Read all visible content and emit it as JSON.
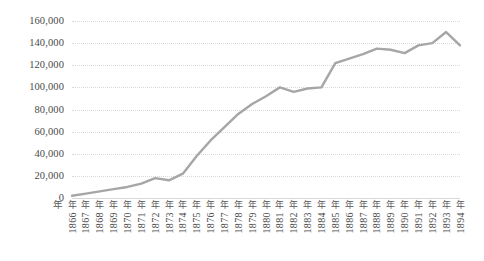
{
  "chart_data": {
    "type": "line",
    "title": "",
    "subtitle": "",
    "xlabel": "",
    "ylabel": "",
    "xlim": [
      1866,
      1894
    ],
    "ylim": [
      0,
      160000
    ],
    "grid": true,
    "legend": false,
    "series_color": "#a6a6a6",
    "axis_unit_label": "年",
    "x_tick_suffix": "年",
    "y_tick_labels": [
      "160,000",
      "140,000",
      "120,000",
      "100,000",
      "80,000",
      "60,000",
      "40,000",
      "20,000",
      "0"
    ],
    "y_tick_values": [
      160000,
      140000,
      120000,
      100000,
      80000,
      60000,
      40000,
      20000,
      0
    ],
    "categories": [
      "1866",
      "1867",
      "1868",
      "1869",
      "1870",
      "1871",
      "1872",
      "1873",
      "1874",
      "1875",
      "1876",
      "1877",
      "1878",
      "1879",
      "1880",
      "1881",
      "1882",
      "1883",
      "1884",
      "1885",
      "1886",
      "1887",
      "1888",
      "1889",
      "1890",
      "1891",
      "1892",
      "1893",
      "1894"
    ],
    "values": [
      2000,
      4000,
      6000,
      8000,
      10000,
      13000,
      18000,
      16000,
      22000,
      38000,
      52000,
      64000,
      76000,
      85000,
      92000,
      100000,
      96000,
      99000,
      100000,
      122000,
      126000,
      130000,
      135000,
      134000,
      131000,
      138000,
      140000,
      150000,
      138000
    ]
  }
}
